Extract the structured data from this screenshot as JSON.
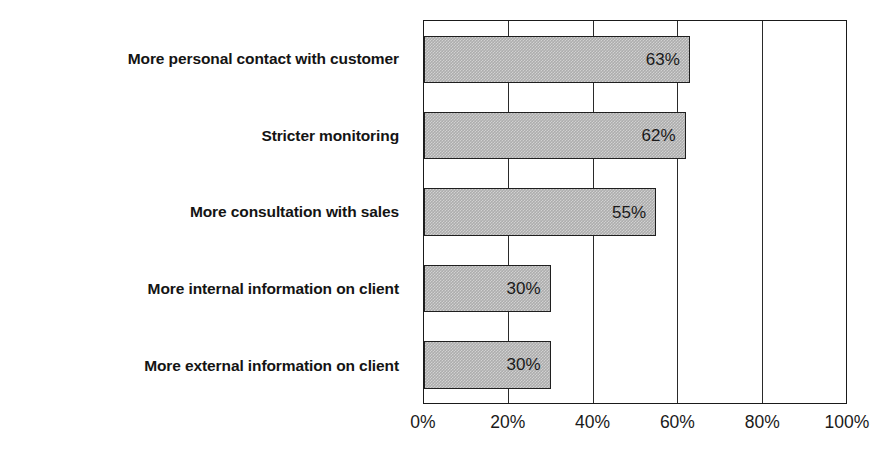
{
  "chart_data": {
    "type": "bar",
    "orientation": "horizontal",
    "title": "",
    "subtitle": "",
    "xlabel": "",
    "ylabel": "",
    "categories": [
      "More personal contact with customer",
      "Stricter monitoring",
      "More consultation with sales",
      "More internal information on client",
      "More external information on client"
    ],
    "values": [
      63,
      62,
      55,
      30,
      30
    ],
    "value_labels": [
      "63%",
      "62%",
      "55%",
      "30%",
      "30%"
    ],
    "xlim": [
      0,
      100
    ],
    "x_ticks": [
      0,
      20,
      40,
      60,
      80,
      100
    ],
    "x_tick_labels": [
      "0%",
      "20%",
      "40%",
      "60%",
      "80%",
      "100%"
    ],
    "grid": true,
    "grid_axis": "x",
    "legend": false,
    "legend_position": "none",
    "colors": {
      "bar_fill": "#adadad",
      "bar_border": "#1f1f1f",
      "axis": "#1a1a1a",
      "grid": "#2a2a2a",
      "label_text": "#141414",
      "value_text": "#1a1a1a",
      "background": "#ffffff"
    }
  }
}
